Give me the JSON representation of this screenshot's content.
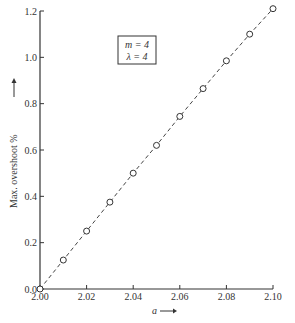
{
  "chart_data": {
    "type": "line",
    "title": "",
    "xlabel": "a",
    "ylabel": "Max. overshoot %",
    "xlim": [
      2.0,
      2.1
    ],
    "ylim": [
      0.0,
      1.2
    ],
    "x_ticks": [
      "2.00",
      "2.02",
      "2.04",
      "2.06",
      "2.08",
      "2.10"
    ],
    "y_ticks": [
      "0.0",
      "0.2",
      "0.4",
      "0.6",
      "0.8",
      "1.0",
      "1.2"
    ],
    "grid": false,
    "legend_box": {
      "lines": [
        "m = 4",
        "λ = 4"
      ]
    },
    "series": [
      {
        "name": "max overshoot",
        "style": "dashed line with open circle markers",
        "x": [
          2.0,
          2.01,
          2.02,
          2.03,
          2.04,
          2.05,
          2.06,
          2.07,
          2.08,
          2.09,
          2.1
        ],
        "values": [
          0.0,
          0.125,
          0.25,
          0.375,
          0.5,
          0.62,
          0.745,
          0.865,
          0.985,
          1.1,
          1.21
        ]
      }
    ]
  },
  "labels": {
    "xlabel": "a",
    "ylabel": "Max. overshoot %",
    "box_line1": "m = 4",
    "box_line2": "λ = 4"
  }
}
